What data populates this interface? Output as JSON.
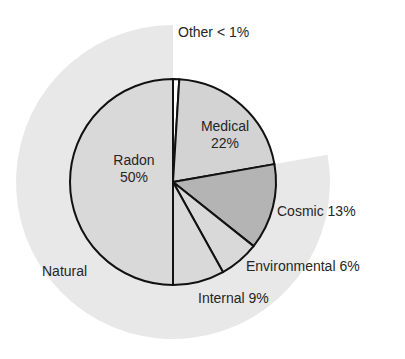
{
  "chart_data": {
    "type": "pie",
    "title": "",
    "start_angle_deg": 0,
    "direction": "clockwise",
    "slices": [
      {
        "name": "Other",
        "label": "Other < 1%",
        "value": 1,
        "color": "#ffffff"
      },
      {
        "name": "Medical",
        "label": "Medical 22%",
        "value": 22,
        "color": "#d3d3d3"
      },
      {
        "name": "Cosmic",
        "label": "Cosmic 13%",
        "value": 13,
        "color": "#b4b4b4"
      },
      {
        "name": "Environmental",
        "label": "Environmental 6%",
        "value": 6,
        "color": "#d9d9d9"
      },
      {
        "name": "Internal",
        "label": "Internal 9%",
        "value": 9,
        "color": "#d9d9d9"
      },
      {
        "name": "Radon",
        "label": "Radon 50%",
        "value": 50,
        "color": "#d9d9d9"
      }
    ],
    "groups": [
      {
        "name": "Natural",
        "label": "Natural",
        "members": [
          "Cosmic",
          "Environmental",
          "Internal",
          "Radon"
        ],
        "color": "#e8e8e8"
      }
    ]
  },
  "labels": {
    "other": "Other < 1%",
    "medical_name": "Medical",
    "medical_pct": "22%",
    "radon_name": "Radon",
    "radon_pct": "50%",
    "cosmic": "Cosmic 13%",
    "environmental": "Environmental 6%",
    "internal": "Internal 9%",
    "natural": "Natural"
  },
  "colors": {
    "outline": "#111111",
    "halo": "#e8e8e8",
    "text": "#262626"
  }
}
